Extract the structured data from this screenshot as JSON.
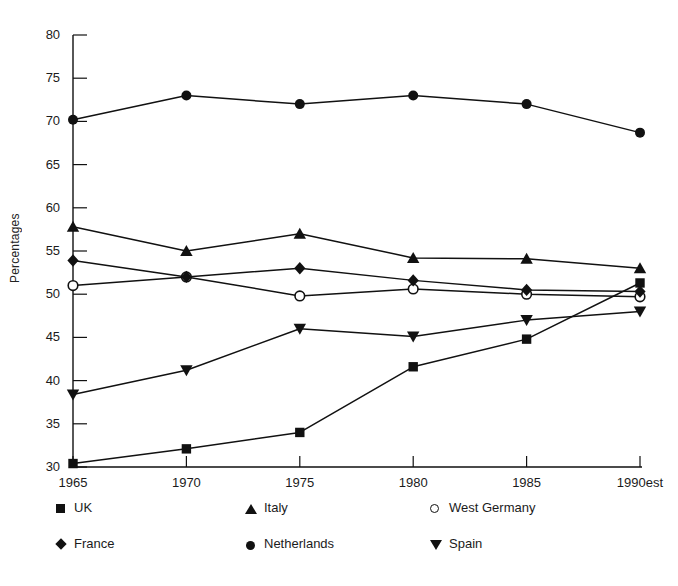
{
  "chart_data": {
    "type": "line",
    "title": "",
    "xlabel": "",
    "ylabel": "Percentages",
    "categories": [
      "1965",
      "1970",
      "1975",
      "1980",
      "1985",
      "1990est"
    ],
    "ylim": [
      30,
      80
    ],
    "yticks": [
      30,
      35,
      40,
      45,
      50,
      55,
      60,
      65,
      70,
      75,
      80
    ],
    "grid": false,
    "legend_position": "bottom",
    "series": [
      {
        "name": "UK",
        "marker": "square",
        "values": [
          30.4,
          32.1,
          34.0,
          41.6,
          44.8,
          51.3
        ]
      },
      {
        "name": "Italy",
        "marker": "triangle-up",
        "values": [
          57.8,
          55.0,
          57.0,
          54.2,
          54.1,
          53.0
        ]
      },
      {
        "name": "West Germany",
        "marker": "circle-open",
        "values": [
          51.0,
          52.0,
          49.8,
          50.6,
          50.0,
          49.7
        ]
      },
      {
        "name": "France",
        "marker": "diamond",
        "values": [
          53.9,
          52.0,
          53.0,
          51.6,
          50.5,
          50.3
        ]
      },
      {
        "name": "Netherlands",
        "marker": "circle-filled",
        "values": [
          70.2,
          73.0,
          72.0,
          73.0,
          72.0,
          68.7
        ]
      },
      {
        "name": "Spain",
        "marker": "triangle-down",
        "values": [
          38.4,
          41.2,
          46.0,
          45.1,
          47.0,
          48.0
        ]
      }
    ]
  },
  "axis": {
    "y_tick_labels": [
      "80",
      "75",
      "70",
      "65",
      "60",
      "55",
      "50",
      "45",
      "40",
      "35",
      "30"
    ],
    "x_tick_labels": [
      "1965",
      "1970",
      "1975",
      "1980",
      "1985",
      "1990est"
    ],
    "y_axis_title": "Percentages"
  },
  "legend": {
    "items": [
      {
        "label": "UK",
        "marker": "square",
        "col": 0,
        "row": 0
      },
      {
        "label": "Italy",
        "marker": "triangle-up",
        "col": 1,
        "row": 0
      },
      {
        "label": "West Germany",
        "marker": "circle-open",
        "col": 2,
        "row": 0
      },
      {
        "label": "France",
        "marker": "diamond",
        "col": 0,
        "row": 1
      },
      {
        "label": "Netherlands",
        "marker": "circle-filled",
        "col": 1,
        "row": 1
      },
      {
        "label": "Spain",
        "marker": "triangle-down",
        "col": 2,
        "row": 1
      }
    ]
  },
  "colors": {
    "ink": "#111111",
    "background": "#ffffff",
    "axis": "#1b1b1b"
  }
}
